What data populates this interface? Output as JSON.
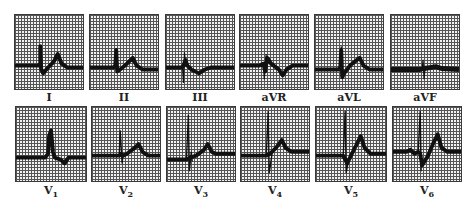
{
  "figure": {
    "rows": [
      {
        "leads": [
          {
            "label": "I",
            "sub": ""
          },
          {
            "label": "II",
            "sub": ""
          },
          {
            "label": "III",
            "sub": ""
          },
          {
            "label": "aVR",
            "sub": ""
          },
          {
            "label": "aVL",
            "sub": ""
          },
          {
            "label": "aVF",
            "sub": ""
          }
        ]
      },
      {
        "leads": [
          {
            "label": "V",
            "sub": "1"
          },
          {
            "label": "V",
            "sub": "2"
          },
          {
            "label": "V",
            "sub": "3"
          },
          {
            "label": "V",
            "sub": "4"
          },
          {
            "label": "V",
            "sub": "5"
          },
          {
            "label": "V",
            "sub": "6"
          }
        ]
      }
    ]
  },
  "colors": {
    "trace": "#111111",
    "grid": "#555555",
    "paper": "#f2f2f2"
  }
}
